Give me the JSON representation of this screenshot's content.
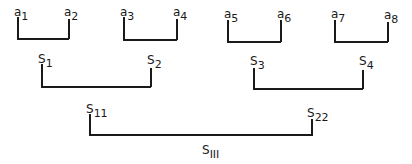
{
  "diagram": {
    "type": "hierarchical-bracket-tree",
    "level1": [
      {
        "left": {
          "base": "a",
          "sub": "1"
        },
        "right": {
          "base": "a",
          "sub": "2"
        }
      },
      {
        "left": {
          "base": "a",
          "sub": "3"
        },
        "right": {
          "base": "a",
          "sub": "4"
        }
      },
      {
        "left": {
          "base": "a",
          "sub": "5"
        },
        "right": {
          "base": "a",
          "sub": "6"
        }
      },
      {
        "left": {
          "base": "a",
          "sub": "7"
        },
        "right": {
          "base": "a",
          "sub": "8"
        }
      }
    ],
    "level2": [
      {
        "left": {
          "base": "S",
          "sub": "1"
        },
        "right": {
          "base": "S",
          "sub": "2"
        }
      },
      {
        "left": {
          "base": "S",
          "sub": "3"
        },
        "right": {
          "base": "S",
          "sub": "4"
        }
      }
    ],
    "level3": [
      {
        "left": {
          "base": "S",
          "sub": "11"
        },
        "right": {
          "base": "S",
          "sub": "22"
        }
      }
    ],
    "root": {
      "base": "S",
      "sub": "III"
    }
  }
}
